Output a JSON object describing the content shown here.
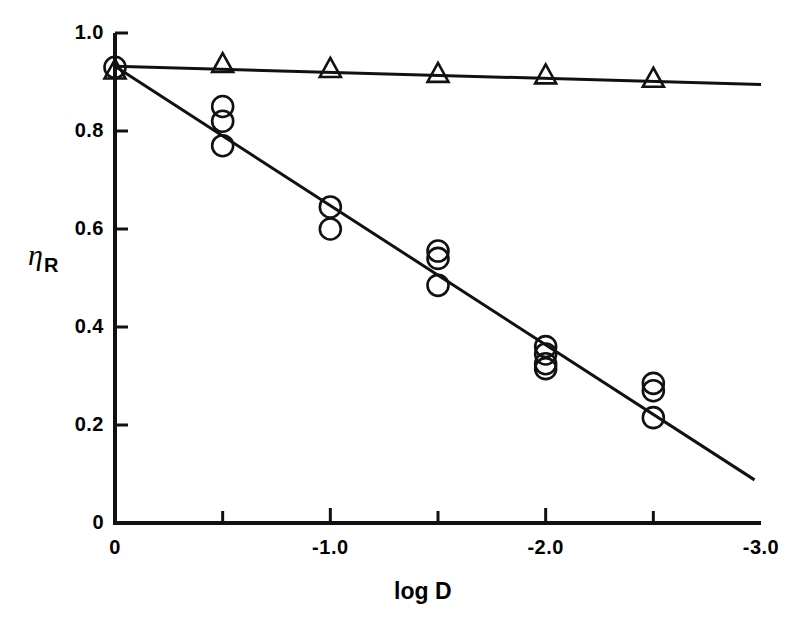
{
  "chart_data": {
    "type": "scatter",
    "title": "",
    "xlabel": "log D",
    "ylabel_main": "η",
    "ylabel_sub": "R",
    "xlim": [
      0.0,
      -3.0
    ],
    "ylim": [
      0.0,
      1.0
    ],
    "grid": false,
    "legend_position": "none",
    "x_ticks_major": [
      "0",
      "-1.0",
      "-2.0",
      "-3.0"
    ],
    "x_ticks_major_values": [
      0.0,
      -1.0,
      -2.0,
      -3.0
    ],
    "x_ticks_minor_values": [
      -0.5,
      -1.5,
      -2.5
    ],
    "y_ticks_major": [
      "1.0",
      "0.8",
      "0.6",
      "0.4",
      "0.2",
      "0"
    ],
    "y_ticks_major_values": [
      1.0,
      0.8,
      0.6,
      0.4,
      0.2,
      0.0
    ],
    "series": [
      {
        "name": "circles",
        "marker": "open-circle",
        "points": [
          {
            "x": 0.0,
            "y": 0.93
          },
          {
            "x": -0.5,
            "y": 0.85
          },
          {
            "x": -0.5,
            "y": 0.82
          },
          {
            "x": -0.5,
            "y": 0.77
          },
          {
            "x": -1.0,
            "y": 0.645
          },
          {
            "x": -1.0,
            "y": 0.6
          },
          {
            "x": -1.5,
            "y": 0.555
          },
          {
            "x": -1.5,
            "y": 0.54
          },
          {
            "x": -1.5,
            "y": 0.485
          },
          {
            "x": -2.0,
            "y": 0.36
          },
          {
            "x": -2.0,
            "y": 0.345
          },
          {
            "x": -2.0,
            "y": 0.325
          },
          {
            "x": -2.0,
            "y": 0.315
          },
          {
            "x": -2.5,
            "y": 0.285
          },
          {
            "x": -2.5,
            "y": 0.27
          },
          {
            "x": -2.5,
            "y": 0.215
          }
        ],
        "fit_line": {
          "x0": 0.0,
          "y0": 0.932,
          "x1": -2.97,
          "y1": 0.088
        }
      },
      {
        "name": "triangles",
        "marker": "open-triangle",
        "points": [
          {
            "x": 0.0,
            "y": 0.922
          },
          {
            "x": -0.5,
            "y": 0.935
          },
          {
            "x": -1.0,
            "y": 0.925
          },
          {
            "x": -1.5,
            "y": 0.915
          },
          {
            "x": -2.0,
            "y": 0.912
          },
          {
            "x": -2.5,
            "y": 0.905
          }
        ],
        "fit_line": {
          "x0": 0.0,
          "y0": 0.932,
          "x1": -3.0,
          "y1": 0.895
        }
      }
    ]
  },
  "geometry": {
    "x_pixel_at_0": 115,
    "x_pixel_at_minus3": 761,
    "y_pixel_at_1": 33,
    "y_pixel_at_0": 523
  }
}
